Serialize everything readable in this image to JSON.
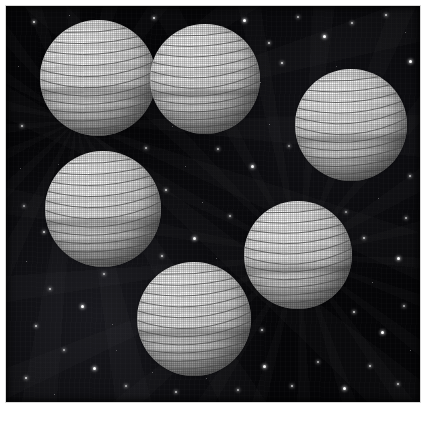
{
  "figure": {
    "medium": "grayscale halftone illustration",
    "background_color": "#050507",
    "frame_color": "#ffffff",
    "sphere_highlight_color": "#ffffff",
    "sphere_shadow_color": "#7c7c7c",
    "band_line_color": "#4a4a4a",
    "star_color": "#ffffff",
    "caption": ""
  },
  "frame": {
    "x": 6,
    "y": 6,
    "width": 414,
    "height": 396
  },
  "spheres": [
    {
      "id": "sphere-1",
      "label": "upper-left sphere",
      "cx": 92,
      "cy": 72,
      "r": 58,
      "band_count": 11,
      "light_angle_deg": 315
    },
    {
      "id": "sphere-2",
      "label": "upper-center sphere",
      "cx": 199,
      "cy": 73,
      "r": 55,
      "band_count": 11,
      "light_angle_deg": 315
    },
    {
      "id": "sphere-3",
      "label": "upper-right sphere",
      "cx": 345,
      "cy": 119,
      "r": 56,
      "band_count": 11,
      "light_angle_deg": 315
    },
    {
      "id": "sphere-4",
      "label": "middle-left sphere",
      "cx": 97,
      "cy": 203,
      "r": 58,
      "band_count": 11,
      "light_angle_deg": 315
    },
    {
      "id": "sphere-5",
      "label": "lower-right sphere",
      "cx": 292,
      "cy": 249,
      "r": 54,
      "band_count": 11,
      "light_angle_deg": 315
    },
    {
      "id": "sphere-6",
      "label": "bottom-center sphere",
      "cx": 188,
      "cy": 313,
      "r": 57,
      "band_count": 11,
      "light_angle_deg": 315
    }
  ],
  "stars": [
    {
      "x": 28,
      "y": 16,
      "s": 2,
      "b": 0.85
    },
    {
      "x": 63,
      "y": 9,
      "s": 1,
      "b": 0.5
    },
    {
      "x": 148,
      "y": 12,
      "s": 2,
      "b": 0.9
    },
    {
      "x": 171,
      "y": 28,
      "s": 1,
      "b": 0.45
    },
    {
      "x": 238,
      "y": 14,
      "s": 3,
      "b": 1.0
    },
    {
      "x": 263,
      "y": 37,
      "s": 2,
      "b": 0.8
    },
    {
      "x": 292,
      "y": 11,
      "s": 2,
      "b": 0.7
    },
    {
      "x": 318,
      "y": 30,
      "s": 3,
      "b": 1.0
    },
    {
      "x": 346,
      "y": 17,
      "s": 2,
      "b": 0.75
    },
    {
      "x": 380,
      "y": 9,
      "s": 2,
      "b": 0.8
    },
    {
      "x": 399,
      "y": 26,
      "s": 1,
      "b": 0.4
    },
    {
      "x": 404,
      "y": 55,
      "s": 3,
      "b": 1.0
    },
    {
      "x": 276,
      "y": 57,
      "s": 2,
      "b": 0.85
    },
    {
      "x": 254,
      "y": 76,
      "s": 1,
      "b": 0.5
    },
    {
      "x": 229,
      "y": 96,
      "s": 2,
      "b": 0.7
    },
    {
      "x": 263,
      "y": 118,
      "s": 1,
      "b": 0.45
    },
    {
      "x": 283,
      "y": 140,
      "s": 2,
      "b": 0.6
    },
    {
      "x": 246,
      "y": 160,
      "s": 3,
      "b": 0.95
    },
    {
      "x": 212,
      "y": 143,
      "s": 2,
      "b": 0.75
    },
    {
      "x": 179,
      "y": 160,
      "s": 1,
      "b": 0.4
    },
    {
      "x": 160,
      "y": 184,
      "s": 2,
      "b": 0.8
    },
    {
      "x": 196,
      "y": 196,
      "s": 1,
      "b": 0.45
    },
    {
      "x": 224,
      "y": 210,
      "s": 2,
      "b": 0.7
    },
    {
      "x": 188,
      "y": 232,
      "s": 3,
      "b": 0.95
    },
    {
      "x": 156,
      "y": 250,
      "s": 2,
      "b": 0.8
    },
    {
      "x": 124,
      "y": 230,
      "s": 1,
      "b": 0.4
    },
    {
      "x": 98,
      "y": 268,
      "s": 2,
      "b": 0.7
    },
    {
      "x": 66,
      "y": 248,
      "s": 3,
      "b": 1.0
    },
    {
      "x": 38,
      "y": 226,
      "s": 2,
      "b": 0.8
    },
    {
      "x": 20,
      "y": 255,
      "s": 1,
      "b": 0.45
    },
    {
      "x": 44,
      "y": 283,
      "s": 2,
      "b": 0.75
    },
    {
      "x": 76,
      "y": 300,
      "s": 3,
      "b": 1.0
    },
    {
      "x": 106,
      "y": 318,
      "s": 1,
      "b": 0.4
    },
    {
      "x": 30,
      "y": 320,
      "s": 2,
      "b": 0.8
    },
    {
      "x": 58,
      "y": 344,
      "s": 2,
      "b": 0.7
    },
    {
      "x": 88,
      "y": 362,
      "s": 3,
      "b": 1.0
    },
    {
      "x": 20,
      "y": 372,
      "s": 2,
      "b": 0.85
    },
    {
      "x": 48,
      "y": 388,
      "s": 1,
      "b": 0.45
    },
    {
      "x": 120,
      "y": 380,
      "s": 2,
      "b": 0.7
    },
    {
      "x": 146,
      "y": 366,
      "s": 1,
      "b": 0.4
    },
    {
      "x": 170,
      "y": 386,
      "s": 2,
      "b": 0.75
    },
    {
      "x": 200,
      "y": 372,
      "s": 1,
      "b": 0.4
    },
    {
      "x": 232,
      "y": 384,
      "s": 2,
      "b": 0.7
    },
    {
      "x": 258,
      "y": 360,
      "s": 3,
      "b": 0.95
    },
    {
      "x": 286,
      "y": 380,
      "s": 2,
      "b": 0.8
    },
    {
      "x": 312,
      "y": 356,
      "s": 2,
      "b": 0.7
    },
    {
      "x": 338,
      "y": 382,
      "s": 3,
      "b": 1.0
    },
    {
      "x": 364,
      "y": 360,
      "s": 2,
      "b": 0.8
    },
    {
      "x": 392,
      "y": 378,
      "s": 2,
      "b": 0.75
    },
    {
      "x": 404,
      "y": 344,
      "s": 1,
      "b": 0.45
    },
    {
      "x": 376,
      "y": 326,
      "s": 3,
      "b": 1.0
    },
    {
      "x": 348,
      "y": 306,
      "s": 2,
      "b": 0.8
    },
    {
      "x": 398,
      "y": 300,
      "s": 2,
      "b": 0.7
    },
    {
      "x": 366,
      "y": 276,
      "s": 1,
      "b": 0.45
    },
    {
      "x": 392,
      "y": 252,
      "s": 3,
      "b": 0.95
    },
    {
      "x": 358,
      "y": 232,
      "s": 2,
      "b": 0.8
    },
    {
      "x": 400,
      "y": 212,
      "s": 2,
      "b": 0.7
    },
    {
      "x": 372,
      "y": 192,
      "s": 1,
      "b": 0.4
    },
    {
      "x": 404,
      "y": 170,
      "s": 2,
      "b": 0.75
    },
    {
      "x": 340,
      "y": 206,
      "s": 2,
      "b": 0.6
    },
    {
      "x": 300,
      "y": 196,
      "s": 1,
      "b": 0.4
    },
    {
      "x": 248,
      "y": 268,
      "s": 2,
      "b": 0.7
    },
    {
      "x": 230,
      "y": 300,
      "s": 1,
      "b": 0.45
    },
    {
      "x": 256,
      "y": 324,
      "s": 2,
      "b": 0.75
    },
    {
      "x": 140,
      "y": 142,
      "s": 2,
      "b": 0.7
    },
    {
      "x": 166,
      "y": 120,
      "s": 1,
      "b": 0.4
    },
    {
      "x": 16,
      "y": 120,
      "s": 2,
      "b": 0.75
    },
    {
      "x": 14,
      "y": 162,
      "s": 1,
      "b": 0.4
    },
    {
      "x": 18,
      "y": 200,
      "s": 2,
      "b": 0.6
    },
    {
      "x": 12,
      "y": 60,
      "s": 1,
      "b": 0.4
    },
    {
      "x": 210,
      "y": 252,
      "s": 1,
      "b": 0.4
    },
    {
      "x": 330,
      "y": 258,
      "s": 1,
      "b": 0.4
    },
    {
      "x": 52,
      "y": 158,
      "s": 1,
      "b": 0.35
    },
    {
      "x": 330,
      "y": 60,
      "s": 1,
      "b": 0.35
    },
    {
      "x": 386,
      "y": 120,
      "s": 1,
      "b": 0.35
    },
    {
      "x": 110,
      "y": 344,
      "s": 1,
      "b": 0.35
    },
    {
      "x": 272,
      "y": 226,
      "s": 1,
      "b": 0.35
    },
    {
      "x": 152,
      "y": 310,
      "s": 1,
      "b": 0.3
    }
  ]
}
